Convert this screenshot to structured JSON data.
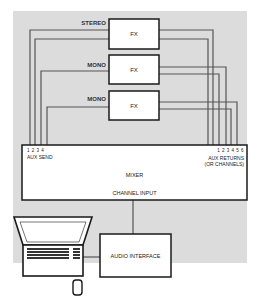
{
  "diagram": {
    "background_color": "#dcdcdc",
    "line_color": "#555555",
    "box_border_color": "#1a1a1a",
    "fx_units": [
      {
        "label": "FX",
        "type_label": "STEREO"
      },
      {
        "label": "FX",
        "type_label": "MONO"
      },
      {
        "label": "FX",
        "type_label": "MONO"
      }
    ],
    "mixer": {
      "title": "MIXER",
      "aux_send_numbers": "1 2 3 4",
      "aux_send_label": "AUX SEND",
      "aux_return_numbers": "1 2 3 4 5 6",
      "aux_return_label": "AUX RETURNS",
      "aux_return_sublabel": "(OR CHANNELS)",
      "channel_input_label": "CHANNEL INPUT"
    },
    "audio_interface": {
      "label": "AUDIO INTERFACE"
    },
    "computer": {
      "icon": "laptop-icon",
      "peripheral": "mouse-icon"
    }
  }
}
